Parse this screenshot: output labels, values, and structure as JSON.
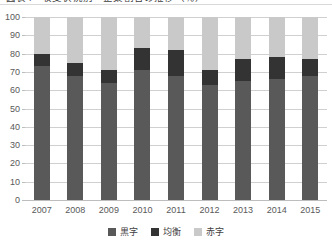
{
  "chart_data": {
    "type": "bar",
    "subtype": "stacked-bar-100",
    "title": "図表4　収支状況別　企業割合の推移（％）",
    "xlabel": "",
    "ylabel": "",
    "ylim": [
      0,
      100
    ],
    "ytick_step": 10,
    "ytick_labels": [
      "100",
      "90",
      "80",
      "70",
      "60",
      "50",
      "40",
      "30",
      "20",
      "10",
      "0"
    ],
    "ytick_values": [
      100,
      90,
      80,
      70,
      60,
      50,
      40,
      30,
      20,
      10,
      0
    ],
    "grid": true,
    "legend_position": "bottom",
    "categories": [
      "2007",
      "2008",
      "2009",
      "2010",
      "2011",
      "2012",
      "2013",
      "2014",
      "2015"
    ],
    "series": [
      {
        "name": "黒字",
        "color": "#595959",
        "values": [
          73,
          68,
          64,
          71,
          68,
          63,
          65,
          66,
          68
        ]
      },
      {
        "name": "均衡",
        "color": "#333333",
        "values": [
          7,
          7,
          7,
          12,
          14,
          8,
          12,
          12,
          9
        ]
      },
      {
        "name": "赤字",
        "color": "#c9c9c9",
        "values": [
          20,
          25,
          29,
          17,
          18,
          29,
          23,
          22,
          23
        ]
      }
    ]
  },
  "colors": {
    "surplus": "#595959",
    "balanced": "#333333",
    "deficit": "#c9c9c9",
    "gridline": "#d0d0d0",
    "axis_text": "#595959",
    "legend_text": "#3f3f3f",
    "background": "#ffffff"
  }
}
